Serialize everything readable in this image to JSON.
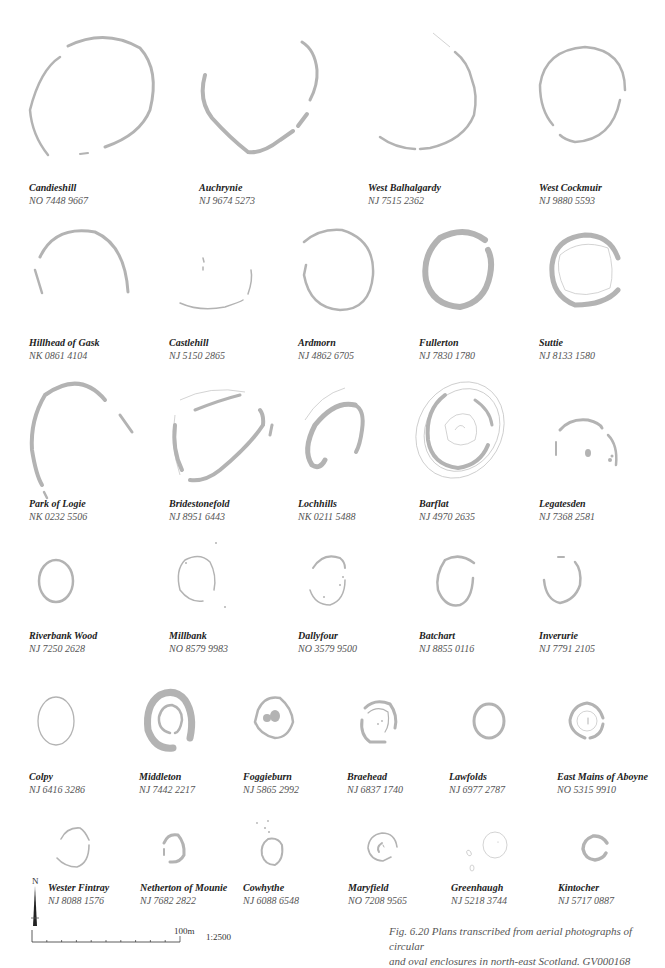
{
  "figure": {
    "caption_line1": "Fig. 6.20  Plans transcribed from aerial photographs of circular",
    "caption_line2": "and oval enclosures in north-east Scotland. GV000168",
    "plan_color": "#b3b3b3"
  },
  "north_arrow": {
    "label": "N"
  },
  "scale_bar": {
    "distance_label": "100m",
    "ratio_label": "1:2500",
    "ticks": 10
  },
  "sites": [
    {
      "name": "Candieshill",
      "grid": "NO 7448 9667"
    },
    {
      "name": "Auchrynie",
      "grid": "NJ 9674 5273"
    },
    {
      "name": "West Balhalgardy",
      "grid": "NJ 7515 2362"
    },
    {
      "name": "West Cockmuir",
      "grid": "NJ 9880 5593"
    },
    {
      "name": "Hillhead of Gask",
      "grid": "NK 0861 4104"
    },
    {
      "name": "Castlehill",
      "grid": "NJ 5150 2865"
    },
    {
      "name": "Ardmorn",
      "grid": "NJ 4862 6705"
    },
    {
      "name": "Fullerton",
      "grid": "NJ 7830 1780"
    },
    {
      "name": "Suttie",
      "grid": "NJ 8133 1580"
    },
    {
      "name": "Park of Logie",
      "grid": "NK 0232 5506"
    },
    {
      "name": "Bridestonefold",
      "grid": "NJ 8951 6443"
    },
    {
      "name": "Lochhills",
      "grid": "NK 0211 5488"
    },
    {
      "name": "Barflat",
      "grid": "NJ 4970 2635"
    },
    {
      "name": "Legatesden",
      "grid": "NJ 7368 2581"
    },
    {
      "name": "Riverbank Wood",
      "grid": "NJ 7250 2628"
    },
    {
      "name": "Millbank",
      "grid": "NO 8579 9983"
    },
    {
      "name": "Dallyfour",
      "grid": "NO 3579 9500"
    },
    {
      "name": "Batchart",
      "grid": "NJ 8855 0116"
    },
    {
      "name": "Inverurie",
      "grid": "NJ 7791 2105"
    },
    {
      "name": "Colpy",
      "grid": "NJ 6416 3286"
    },
    {
      "name": "Middleton",
      "grid": "NJ 7442 2217"
    },
    {
      "name": "Foggieburn",
      "grid": "NJ 5865 2992"
    },
    {
      "name": "Braehead",
      "grid": "NJ 6837 1740"
    },
    {
      "name": "Lawfolds",
      "grid": "NJ 6977 2787"
    },
    {
      "name": "East Mains of Aboyne",
      "grid": "NO 5315 9910"
    },
    {
      "name": "Wester Fintray",
      "grid": "NJ 8088 1576"
    },
    {
      "name": "Netherton of Mounie",
      "grid": "NJ 7682 2822"
    },
    {
      "name": "Cowhythe",
      "grid": "NJ 6088 6548"
    },
    {
      "name": "Maryfield",
      "grid": "NO 7208 9565"
    },
    {
      "name": "Greenhaugh",
      "grid": "NJ 5218 3744"
    },
    {
      "name": "Kintocher",
      "grid": "NJ 5717 0887"
    }
  ]
}
